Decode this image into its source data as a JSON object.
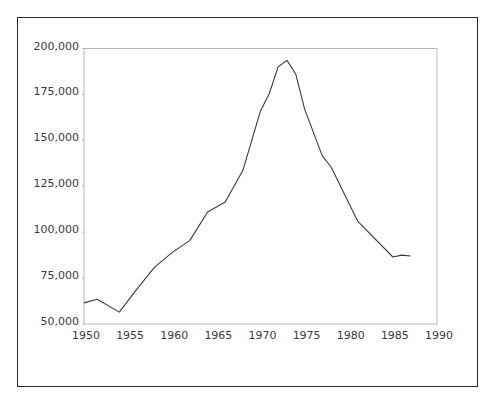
{
  "chart_data": {
    "type": "line",
    "title": "",
    "xlabel": "",
    "ylabel": "",
    "xlim": [
      1950,
      1990
    ],
    "ylim": [
      50000,
      200000
    ],
    "grid": false,
    "legend": null,
    "x_ticks": [
      1950,
      1955,
      1960,
      1965,
      1970,
      1975,
      1980,
      1985,
      1990
    ],
    "x_tick_labels": [
      "1950",
      "1955",
      "1960",
      "1965",
      "1970",
      "1975",
      "1980",
      "1985",
      "1990"
    ],
    "y_ticks": [
      50000,
      75000,
      100000,
      125000,
      150000,
      175000,
      200000
    ],
    "y_tick_labels": [
      "50,000",
      "75,000",
      "100,000",
      "125,000",
      "150,000",
      "175,000",
      "200,000"
    ],
    "series": [
      {
        "name": "series",
        "color": "#3a3a3a",
        "x": [
          1950,
          1951.5,
          1954,
          1956,
          1958,
          1960,
          1962,
          1964,
          1966,
          1968,
          1970,
          1971,
          1972,
          1973,
          1974,
          1975,
          1977,
          1978,
          1981,
          1985,
          1986,
          1987
        ],
        "values": [
          61500,
          63500,
          56500,
          69000,
          81000,
          89000,
          95500,
          111000,
          116500,
          133500,
          166000,
          175500,
          190000,
          193500,
          186000,
          167000,
          141500,
          135500,
          106000,
          86500,
          87500,
          87000
        ]
      }
    ]
  },
  "colors": {
    "frame": "#2a2a2a",
    "axes": "#b8b8b8",
    "line": "#3a3a3a",
    "text": "#3a3a3a"
  }
}
